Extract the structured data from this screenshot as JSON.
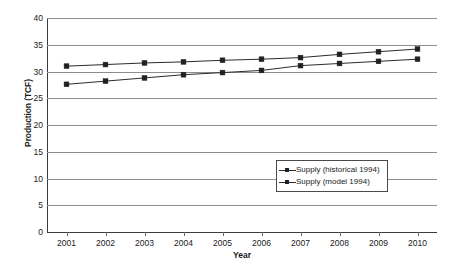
{
  "chart_data": {
    "type": "line",
    "title": "",
    "xlabel": "Year",
    "ylabel": "Production (TCF)",
    "categories": [
      "2001",
      "2002",
      "2003",
      "2004",
      "2005",
      "2006",
      "2007",
      "2008",
      "2009",
      "2010"
    ],
    "x": [
      2001,
      2002,
      2003,
      2004,
      2005,
      2006,
      2007,
      2008,
      2009,
      2010
    ],
    "ylim": [
      0,
      40
    ],
    "yticks": [
      0,
      5,
      10,
      15,
      20,
      25,
      30,
      35,
      40
    ],
    "ytick_labels": [
      "0",
      "5",
      "10",
      "15",
      "20",
      "25",
      "30",
      "35",
      "40"
    ],
    "grid": true,
    "legend_position": "center-right",
    "series": [
      {
        "name": "Supply (historical 1994)",
        "values": [
          31.0,
          31.3,
          31.6,
          31.8,
          32.1,
          32.3,
          32.6,
          33.2,
          33.7,
          34.2
        ],
        "color": "#2b2b2b",
        "marker": "square"
      },
      {
        "name": "Supply (model 1994)",
        "values": [
          27.6,
          28.2,
          28.8,
          29.4,
          29.8,
          30.2,
          31.1,
          31.5,
          31.9,
          32.3
        ],
        "color": "#2b2b2b",
        "marker": "square"
      }
    ]
  }
}
